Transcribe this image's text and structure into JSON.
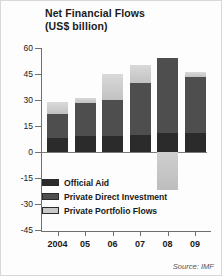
{
  "title_line1": "Net Financial Flows",
  "title_line2": "(US$ billion)",
  "source": "Source: IMF",
  "legend": [
    {
      "key": "aid",
      "label": "Official Aid",
      "color": "#2b2b2b"
    },
    {
      "key": "fdi",
      "label": "Private Direct Investment",
      "color": "#4e4e4e"
    },
    {
      "key": "ppf",
      "label": "Private Portfolio Flows",
      "color": "#c9c9c9"
    }
  ],
  "chart_data": {
    "type": "bar",
    "subtype": "stacked-bar",
    "title": "Net Financial Flows (US$ billion)",
    "xlabel": "",
    "ylabel": "US$ billion",
    "ylim": [
      -45,
      60
    ],
    "yticks": [
      60,
      45,
      30,
      15,
      0,
      -15,
      -30,
      -45
    ],
    "ytick_labels": [
      "60",
      "45",
      "30",
      "15",
      "0",
      "-15",
      "-30",
      "-45"
    ],
    "grid": false,
    "legend_position": "inside-bottom-left",
    "categories": [
      "2004",
      "05",
      "06",
      "07",
      "08",
      "09"
    ],
    "xtick_labels": [
      "2004",
      "05",
      "06",
      "07",
      "08",
      "09"
    ],
    "series": [
      {
        "name": "Official Aid",
        "color": "#2b2b2b",
        "values": [
          8,
          9,
          9,
          10,
          11,
          11
        ]
      },
      {
        "name": "Private Direct Investment",
        "color": "#4e4e4e",
        "values": [
          14,
          19,
          21,
          30,
          43,
          32
        ]
      },
      {
        "name": "Private Portfolio Flows",
        "color": "#c9c9c9",
        "values": [
          7,
          3,
          15,
          10,
          -22,
          3
        ]
      }
    ],
    "totals_positive": [
      29,
      31,
      45,
      50,
      54,
      46
    ],
    "annotations": [
      "2008 private portfolio flows are negative, extending below the zero line to about -22"
    ],
    "source": "Source: IMF"
  }
}
